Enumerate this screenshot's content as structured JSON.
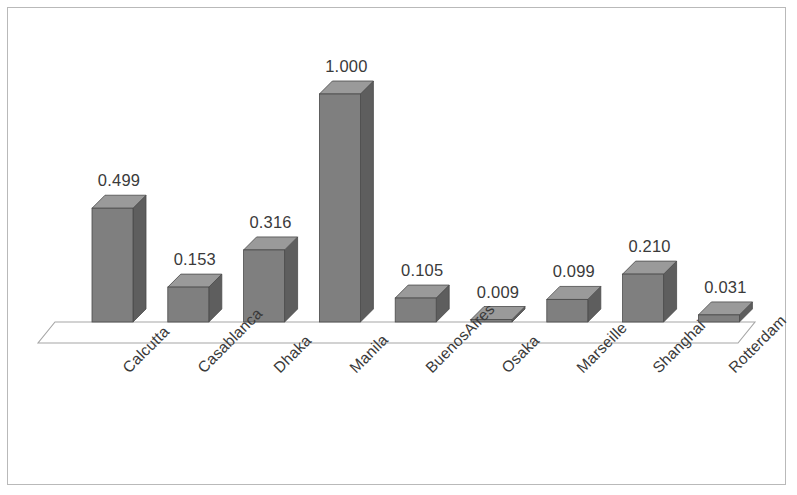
{
  "chart_data": {
    "type": "bar",
    "title": "",
    "subtitle": "",
    "xlabel": "",
    "ylabel": "",
    "categories": [
      "Calcutta",
      "Casablanca",
      "Dhaka",
      "Manila",
      "BuenosAires",
      "Osaka",
      "Marseille",
      "Shanghai",
      "Rotterdam"
    ],
    "values": [
      0.499,
      0.153,
      0.316,
      1.0,
      0.105,
      0.009,
      0.099,
      0.21,
      0.031
    ],
    "value_labels": [
      "0.499",
      "0.153",
      "0.316",
      "1.000",
      "0.105",
      "0.009",
      "0.099",
      "0.210",
      "0.031"
    ],
    "ylim": [
      0,
      1.0
    ],
    "grid": false,
    "legend": false,
    "legend_position": "none",
    "axis_ticks_visible": false,
    "data_labels_shown": true,
    "three_d": true,
    "series": [
      {
        "name": "",
        "values": [
          0.499,
          0.153,
          0.316,
          1.0,
          0.105,
          0.009,
          0.099,
          0.21,
          0.031
        ]
      }
    ]
  },
  "style": {
    "bar_front_color": "#7f7f7f",
    "bar_top_color": "#9a9a9a",
    "bar_side_color": "#5e5e5e",
    "bar_edge_color": "#4a4a4a",
    "floor_line_color": "#a6a6a6",
    "frame_color": "#b9b9b9",
    "background_color": "#ffffff",
    "label_color": "#3a3a3a"
  },
  "axis": {
    "category_label_rotation": "-45"
  }
}
